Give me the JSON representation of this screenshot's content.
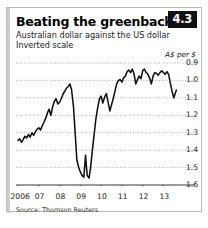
{
  "card": {
    "title": "Beating the greenback",
    "badge": "4.3",
    "subtitle": "Australian dollar against the US dollar",
    "subtitle2": "Inverted scale",
    "unit_label": "A$ per $",
    "source": "Source: Thomson Reuters"
  },
  "chart_data": {
    "type": "line",
    "title": "Beating the greenback",
    "subtitle": "Australian dollar against the US dollar",
    "note": "Inverted scale",
    "xlabel": "",
    "ylabel": "A$ per $",
    "ylim": [
      0.9,
      1.6
    ],
    "y_inverted": true,
    "yticks": [
      0.9,
      1.0,
      1.1,
      1.2,
      1.3,
      1.4,
      1.5,
      1.6
    ],
    "ytick_labels": [
      "0.9",
      "1.0",
      "1.1",
      "1.2",
      "1.3",
      "1.4",
      "1.5",
      "1.6"
    ],
    "xlim": [
      2006.0,
      2013.7
    ],
    "xticks": [
      2006,
      2007,
      2008,
      2009,
      2010,
      2011,
      2012,
      2013
    ],
    "xtick_labels": [
      "2006",
      "07",
      "08",
      "09",
      "10",
      "11",
      "12",
      "13"
    ],
    "grid": "horizontal-dotted",
    "legend": "none",
    "line_color": "#111111",
    "series": [
      {
        "name": "A$ per US$",
        "x": [
          2006.0,
          2006.08,
          2006.17,
          2006.25,
          2006.33,
          2006.42,
          2006.5,
          2006.58,
          2006.67,
          2006.75,
          2006.83,
          2006.92,
          2007.0,
          2007.08,
          2007.17,
          2007.25,
          2007.33,
          2007.42,
          2007.5,
          2007.58,
          2007.67,
          2007.75,
          2007.83,
          2007.92,
          2008.0,
          2008.08,
          2008.17,
          2008.25,
          2008.33,
          2008.42,
          2008.5,
          2008.58,
          2008.67,
          2008.75,
          2008.83,
          2008.92,
          2009.0,
          2009.08,
          2009.17,
          2009.25,
          2009.33,
          2009.42,
          2009.5,
          2009.58,
          2009.67,
          2009.75,
          2009.83,
          2009.92,
          2010.0,
          2010.08,
          2010.17,
          2010.25,
          2010.33,
          2010.42,
          2010.5,
          2010.58,
          2010.67,
          2010.75,
          2010.83,
          2010.92,
          2011.0,
          2011.08,
          2011.17,
          2011.25,
          2011.33,
          2011.42,
          2011.5,
          2011.58,
          2011.67,
          2011.75,
          2011.83,
          2011.92,
          2012.0,
          2012.08,
          2012.17,
          2012.25,
          2012.33,
          2012.42,
          2012.5,
          2012.58,
          2012.67,
          2012.75,
          2012.83,
          2012.92,
          2013.0,
          2013.08,
          2013.17,
          2013.25,
          2013.33,
          2013.42,
          2013.5,
          2013.58,
          2013.62
        ],
        "values": [
          1.345,
          1.335,
          1.355,
          1.34,
          1.32,
          1.33,
          1.31,
          1.325,
          1.3,
          1.315,
          1.295,
          1.28,
          1.272,
          1.285,
          1.26,
          1.24,
          1.218,
          1.185,
          1.165,
          1.2,
          1.15,
          1.12,
          1.105,
          1.135,
          1.125,
          1.105,
          1.078,
          1.062,
          1.045,
          1.035,
          1.02,
          1.055,
          1.15,
          1.3,
          1.455,
          1.5,
          1.525,
          1.545,
          1.555,
          1.43,
          1.545,
          1.56,
          1.495,
          1.4,
          1.305,
          1.22,
          1.16,
          1.105,
          1.09,
          1.13,
          1.095,
          1.075,
          1.12,
          1.175,
          1.14,
          1.105,
          1.06,
          1.02,
          1.0,
          0.995,
          1.01,
          0.985,
          0.975,
          0.95,
          0.94,
          0.955,
          0.935,
          0.96,
          1.02,
          0.995,
          0.975,
          0.99,
          0.945,
          0.935,
          0.955,
          0.965,
          0.985,
          1.02,
          0.975,
          0.955,
          0.96,
          0.97,
          0.955,
          0.945,
          0.955,
          0.965,
          0.95,
          0.965,
          1.015,
          1.065,
          1.1,
          1.07,
          1.055
        ]
      }
    ]
  }
}
